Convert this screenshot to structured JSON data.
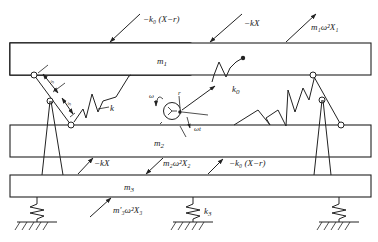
{
  "diagram": {
    "masses": {
      "m1": "m",
      "m1_sub": "1",
      "m2": "m",
      "m2_sub": "2",
      "m3": "m",
      "m3_sub": "3"
    },
    "springs": {
      "k": "k",
      "k0": "k",
      "k0_sub": "0",
      "k3": "k",
      "k3_sub": "3"
    },
    "forces": {
      "top_left": "−k₀ (X−r)",
      "top_mid": "−kX",
      "top_right": "m₁ω²X₁",
      "mid_left": "−kX",
      "mid_center": "m₂ω²X₂",
      "mid_right": "−k₀ (X−r)",
      "bottom": "m′₃ω²X₃"
    },
    "rotor": {
      "omega": "ω",
      "radius": "r",
      "angle": "ωt"
    },
    "links": {
      "s1": "s",
      "s2": "s"
    }
  }
}
